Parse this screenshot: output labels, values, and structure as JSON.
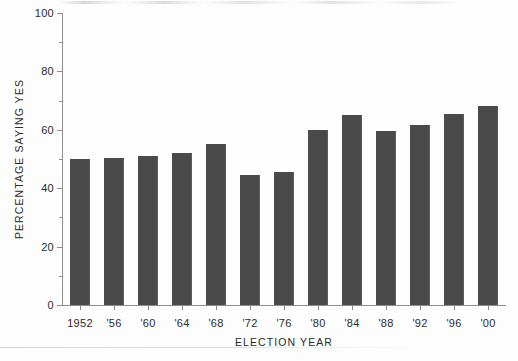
{
  "chart_data": {
    "type": "bar",
    "title": "",
    "subtitle": "",
    "xlabel": "ELECTION YEAR",
    "ylabel": "PERCENTAGE SAYING YES",
    "categories": [
      "1952",
      "'56",
      "'60",
      "'64",
      "'68",
      "'72",
      "'76",
      "'80",
      "'84",
      "'88",
      "'92",
      "'96",
      "'00"
    ],
    "values": [
      50,
      50.5,
      51,
      52,
      55,
      44.5,
      45.5,
      60,
      65,
      59.5,
      61.5,
      65.5,
      68
    ],
    "series": [
      {
        "name": "Percentage saying yes",
        "values": [
          50,
          50.5,
          51,
          52,
          55,
          44.5,
          45.5,
          60,
          65,
          59.5,
          61.5,
          65.5,
          68
        ],
        "color": "#4a4a4a"
      }
    ],
    "ylim": [
      0,
      100
    ],
    "ytick_labels": [
      "0",
      "20",
      "40",
      "60",
      "80",
      "100"
    ],
    "ytick_values": [
      0,
      20,
      40,
      60,
      80,
      100
    ],
    "yminor_tick_values": [
      10,
      30,
      50,
      70,
      90
    ],
    "grid": false,
    "legend": false,
    "legend_position": "none",
    "bar_color": "#4a4a4a",
    "axis_color": "#8d8d8d",
    "background_color": "#fdfdfd"
  }
}
